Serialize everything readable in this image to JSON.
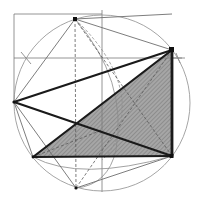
{
  "diagram": {
    "colors": {
      "background": "#ffffff",
      "thin_line": "#8a8a8a",
      "thick_line": "#1a1a1a",
      "shade": "#9a9a9a",
      "construction": "#6a6a6a"
    },
    "points": {
      "T": [
        75,
        19
      ],
      "L": [
        14,
        102
      ],
      "B": [
        76,
        188
      ],
      "A": [
        172,
        50
      ],
      "C": [
        172,
        156
      ],
      "D": [
        33,
        157
      ],
      "O": [
        102,
        103
      ]
    },
    "big_circle": {
      "cx": 102,
      "cy": 103,
      "r": 88
    },
    "shaded_triangle": [
      "D",
      "A",
      "C"
    ],
    "labels": []
  }
}
